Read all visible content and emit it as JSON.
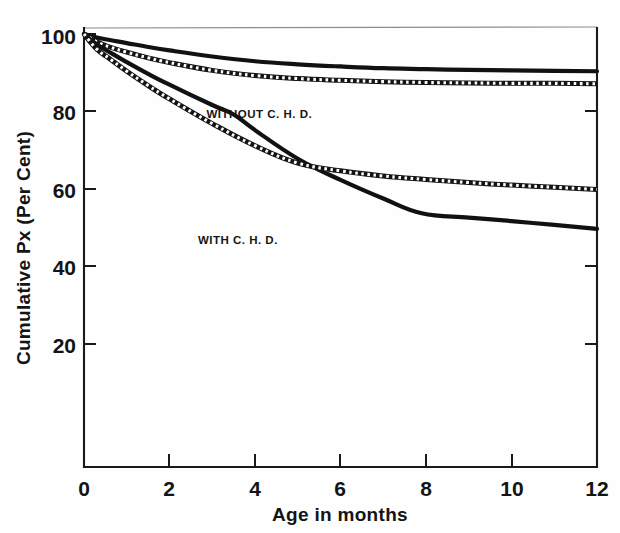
{
  "chart_data": {
    "type": "line",
    "title": "",
    "subtitle": "",
    "xlabel": "Age in months",
    "ylabel": "Cumulative Px (Per Cent)",
    "xlim": [
      0,
      12
    ],
    "ylim": [
      0,
      100
    ],
    "xticks": [
      0,
      2,
      4,
      6,
      8,
      10,
      12
    ],
    "xtick_labels": [
      "0",
      "2",
      "4",
      "6",
      "8",
      "10",
      "12"
    ],
    "yticks": [
      20,
      40,
      60,
      80,
      100
    ],
    "ytick_labels": [
      "20",
      "40",
      "60",
      "80",
      "100"
    ],
    "grid": false,
    "legend_position": "inline-annotation",
    "annotations": [
      {
        "text": "WITHOUT C. H. D.",
        "x": 4.1,
        "y": 80.5
      },
      {
        "text": "WITH C. H. D.",
        "x": 3.6,
        "y": 51.5
      }
    ],
    "series": [
      {
        "name": "WITHOUT C. H. D.",
        "style": "solid",
        "role": "survival-estimate",
        "x": [
          0,
          0.3,
          0.6,
          1.0,
          1.5,
          2.0,
          3.0,
          4.0,
          5.0,
          6.0,
          7.0,
          8.0,
          9.0,
          10.0,
          11.0,
          12.0
        ],
        "values": [
          100,
          99.2,
          98.6,
          97.9,
          97.0,
          96.2,
          94.8,
          93.7,
          93.0,
          92.5,
          92.1,
          91.9,
          91.7,
          91.6,
          91.5,
          91.4
        ]
      },
      {
        "name": "WITHOUT C. H. D. lower confidence band",
        "style": "hatched",
        "role": "confidence-band",
        "x": [
          0,
          0.3,
          0.6,
          1.0,
          1.5,
          2.0,
          3.0,
          4.0,
          5.0,
          6.0,
          7.0,
          8.0,
          9.0,
          10.0,
          11.0,
          12.0
        ],
        "values": [
          100,
          98.2,
          97.0,
          95.8,
          94.5,
          93.4,
          91.6,
          90.4,
          89.7,
          89.3,
          89.0,
          88.8,
          88.7,
          88.6,
          88.6,
          88.5
        ]
      },
      {
        "name": "WITH C. H. D.",
        "style": "solid",
        "role": "survival-estimate",
        "x": [
          0,
          0.3,
          0.6,
          1.0,
          1.5,
          2.0,
          3.0,
          3.5,
          4.0,
          5.0,
          6.0,
          7.0,
          7.9,
          9.0,
          10.0,
          11.0,
          12.0
        ],
        "values": [
          100,
          97.6,
          95.8,
          93.5,
          90.8,
          88.3,
          83.6,
          81.4,
          77.8,
          71.2,
          66.3,
          62.0,
          58.6,
          57.6,
          56.8,
          55.9,
          55.0
        ]
      },
      {
        "name": "WITH C. H. D. lower confidence band",
        "style": "hatched",
        "role": "confidence-band",
        "x": [
          0,
          0.3,
          0.6,
          1.0,
          1.5,
          2.0,
          3.0,
          4.0,
          5.0,
          6.0,
          7.0,
          8.0,
          9.0,
          10.0,
          11.0,
          12.0
        ],
        "values": [
          100,
          96.5,
          94.3,
          91.4,
          88.1,
          85.0,
          79.3,
          74.2,
          70.2,
          68.4,
          67.2,
          66.4,
          65.7,
          65.1,
          64.6,
          64.1
        ]
      }
    ]
  },
  "figure": {
    "background_color": "#ffffff",
    "ink_color": "#111111",
    "band_fill_color": "#ffffff"
  }
}
